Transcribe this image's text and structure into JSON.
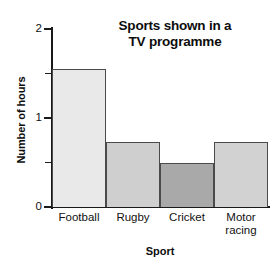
{
  "chart_data": {
    "type": "bar",
    "title": "Sports shown in a TV programme",
    "title_lines": [
      "Sports shown in a",
      "TV programme"
    ],
    "xlabel": "Sport",
    "ylabel": "Number of hours",
    "categories": [
      "Football",
      "Rugby",
      "Cricket",
      "Motor racing"
    ],
    "category_label_lines": [
      [
        "Football"
      ],
      [
        "Rugby"
      ],
      [
        "Cricket"
      ],
      [
        "Motor",
        "racing"
      ]
    ],
    "values": [
      1.55,
      0.73,
      0.5,
      0.73
    ],
    "bar_colors": [
      "#e9e9e9",
      "#cfcfcf",
      "#a9a9a9",
      "#d2d2d2"
    ],
    "bar_border_color": "#4a4a4a",
    "ylim": [
      0,
      2
    ],
    "ytick_values": [
      0,
      0.5,
      1,
      1.5,
      2
    ],
    "ytick_labels": [
      "0",
      "",
      "1",
      "",
      "2"
    ],
    "grid": false,
    "legend": "none",
    "axis_color": "#1a1a1a"
  }
}
